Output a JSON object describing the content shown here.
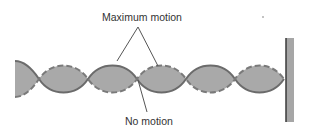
{
  "labels": {
    "maximum_motion": "Maximum motion",
    "no_motion": "No motion"
  },
  "colors": {
    "fill": "#a9a9a9",
    "solid_line": "#6b6b6b",
    "dashed_line": "#7a7a7a",
    "wall_fill": "#a6a6a6",
    "wall_edge": "#3a3a3a",
    "text": "#333333",
    "leader_line": "#555555"
  },
  "wave": {
    "start_x": 15,
    "axis_y": 79,
    "amplitude": 18,
    "node_x": [
      39,
      88,
      137,
      186,
      235,
      284
    ],
    "loops": 5
  },
  "wall": {
    "x": 286,
    "y": 38,
    "width": 8,
    "height": 84
  }
}
